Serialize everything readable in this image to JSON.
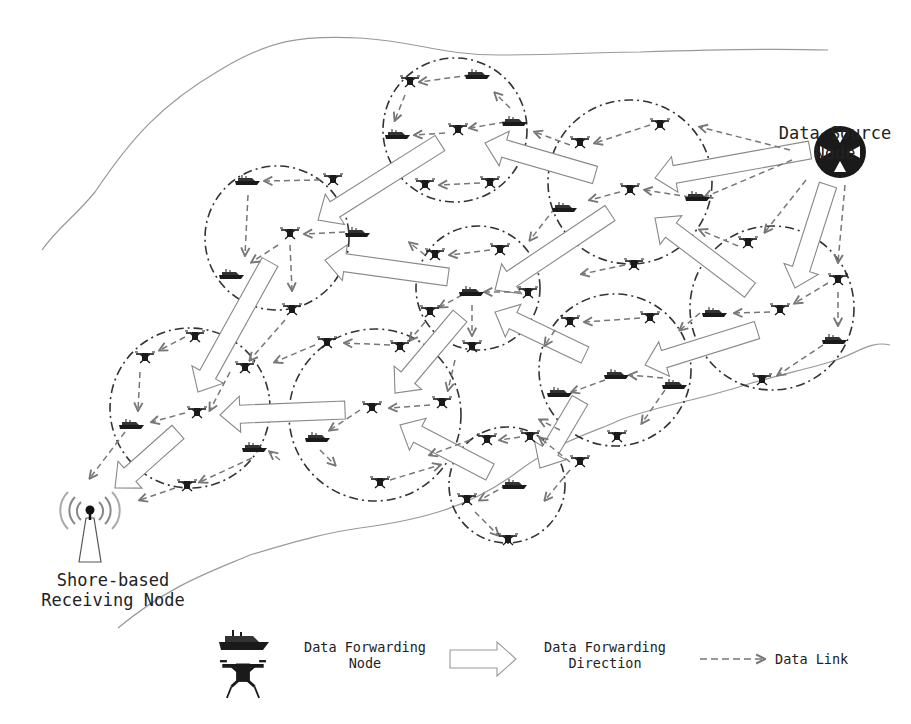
{
  "diagram": {
    "labels": {
      "source_line1": "Data Source",
      "source_line2": "Node",
      "shore_line1": "Shore-based",
      "shore_line2": "Receiving Node"
    },
    "legend": {
      "node_line1": "Data Forwarding",
      "node_line2": "Node",
      "direction_line1": "Data Forwarding",
      "direction_line2": "Direction",
      "link": "Data Link"
    },
    "colors": {
      "cluster_circle": "#333333",
      "data_link": "#777777",
      "forward_arrow_stroke": "#888888",
      "coastline": "#999999",
      "node_fill": "#1a1a1a",
      "text": "#222222"
    },
    "clusters": [
      {
        "cx": 455,
        "cy": 130,
        "r": 72
      },
      {
        "cx": 277,
        "cy": 238,
        "r": 72
      },
      {
        "cx": 630,
        "cy": 182,
        "r": 82
      },
      {
        "cx": 478,
        "cy": 288,
        "r": 62
      },
      {
        "cx": 772,
        "cy": 308,
        "r": 82
      },
      {
        "cx": 190,
        "cy": 408,
        "r": 80
      },
      {
        "cx": 375,
        "cy": 415,
        "r": 86
      },
      {
        "cx": 615,
        "cy": 370,
        "r": 76
      },
      {
        "cx": 507,
        "cy": 485,
        "r": 58
      }
    ],
    "nodes": [
      {
        "type": "drone",
        "x": 410,
        "y": 82
      },
      {
        "type": "boat",
        "x": 478,
        "y": 75
      },
      {
        "type": "boat",
        "x": 398,
        "y": 135
      },
      {
        "type": "drone",
        "x": 458,
        "y": 130
      },
      {
        "type": "boat",
        "x": 515,
        "y": 122
      },
      {
        "type": "drone",
        "x": 425,
        "y": 185
      },
      {
        "type": "drone",
        "x": 490,
        "y": 183
      },
      {
        "type": "boat",
        "x": 248,
        "y": 181
      },
      {
        "type": "drone",
        "x": 333,
        "y": 180
      },
      {
        "type": "drone",
        "x": 290,
        "y": 234
      },
      {
        "type": "boat",
        "x": 358,
        "y": 233
      },
      {
        "type": "boat",
        "x": 232,
        "y": 275
      },
      {
        "type": "drone",
        "x": 292,
        "y": 310
      },
      {
        "type": "drone",
        "x": 660,
        "y": 125
      },
      {
        "type": "drone",
        "x": 580,
        "y": 143
      },
      {
        "type": "drone",
        "x": 630,
        "y": 190
      },
      {
        "type": "boat",
        "x": 698,
        "y": 197
      },
      {
        "type": "boat",
        "x": 565,
        "y": 208
      },
      {
        "type": "drone",
        "x": 435,
        "y": 255
      },
      {
        "type": "drone",
        "x": 500,
        "y": 250
      },
      {
        "type": "boat",
        "x": 472,
        "y": 292
      },
      {
        "type": "drone",
        "x": 528,
        "y": 293
      },
      {
        "type": "drone",
        "x": 430,
        "y": 312
      },
      {
        "type": "drone",
        "x": 472,
        "y": 347
      },
      {
        "type": "drone",
        "x": 748,
        "y": 243
      },
      {
        "type": "drone",
        "x": 838,
        "y": 280
      },
      {
        "type": "drone",
        "x": 780,
        "y": 310
      },
      {
        "type": "boat",
        "x": 715,
        "y": 313
      },
      {
        "type": "boat",
        "x": 835,
        "y": 340
      },
      {
        "type": "drone",
        "x": 762,
        "y": 380
      },
      {
        "type": "drone",
        "x": 634,
        "y": 265
      },
      {
        "type": "drone",
        "x": 570,
        "y": 322
      },
      {
        "type": "drone",
        "x": 650,
        "y": 318
      },
      {
        "type": "boat",
        "x": 617,
        "y": 375
      },
      {
        "type": "boat",
        "x": 675,
        "y": 385
      },
      {
        "type": "boat",
        "x": 560,
        "y": 393
      },
      {
        "type": "drone",
        "x": 617,
        "y": 437
      },
      {
        "type": "drone",
        "x": 145,
        "y": 358
      },
      {
        "type": "drone",
        "x": 195,
        "y": 337
      },
      {
        "type": "drone",
        "x": 245,
        "y": 368
      },
      {
        "type": "drone",
        "x": 197,
        "y": 413
      },
      {
        "type": "boat",
        "x": 132,
        "y": 425
      },
      {
        "type": "boat",
        "x": 255,
        "y": 448
      },
      {
        "type": "drone",
        "x": 187,
        "y": 486
      },
      {
        "type": "drone",
        "x": 327,
        "y": 343
      },
      {
        "type": "drone",
        "x": 400,
        "y": 347
      },
      {
        "type": "drone",
        "x": 372,
        "y": 408
      },
      {
        "type": "drone",
        "x": 442,
        "y": 403
      },
      {
        "type": "boat",
        "x": 318,
        "y": 438
      },
      {
        "type": "drone",
        "x": 380,
        "y": 483
      },
      {
        "type": "drone",
        "x": 487,
        "y": 440
      },
      {
        "type": "drone",
        "x": 530,
        "y": 437
      },
      {
        "type": "drone",
        "x": 580,
        "y": 462
      },
      {
        "type": "boat",
        "x": 515,
        "y": 485
      },
      {
        "type": "drone",
        "x": 467,
        "y": 500
      },
      {
        "type": "drone",
        "x": 508,
        "y": 540
      }
    ],
    "links": [
      [
        470,
        75,
        420,
        82
      ],
      [
        510,
        108,
        495,
        93
      ],
      [
        405,
        95,
        395,
        120
      ],
      [
        505,
        122,
        470,
        128
      ],
      [
        445,
        133,
        415,
        135
      ],
      [
        480,
        183,
        440,
        185
      ],
      [
        320,
        180,
        265,
        181
      ],
      [
        345,
        232,
        305,
        234
      ],
      [
        248,
        195,
        245,
        255
      ],
      [
        278,
        245,
        252,
        262
      ],
      [
        290,
        245,
        292,
        290
      ],
      [
        650,
        125,
        595,
        143
      ],
      [
        570,
        145,
        535,
        132
      ],
      [
        690,
        197,
        645,
        190
      ],
      [
        620,
        192,
        590,
        200
      ],
      [
        790,
        150,
        700,
        127
      ],
      [
        792,
        160,
        705,
        197
      ],
      [
        425,
        255,
        410,
        243
      ],
      [
        490,
        250,
        450,
        255
      ],
      [
        520,
        292,
        485,
        292
      ],
      [
        462,
        295,
        440,
        307
      ],
      [
        472,
        305,
        472,
        335
      ],
      [
        555,
        208,
        530,
        240
      ],
      [
        806,
        180,
        765,
        232
      ],
      [
        845,
        185,
        838,
        262
      ],
      [
        828,
        283,
        795,
        303
      ],
      [
        770,
        312,
        735,
        313
      ],
      [
        838,
        292,
        838,
        325
      ],
      [
        823,
        345,
        778,
        375
      ],
      [
        738,
        246,
        700,
        230
      ],
      [
        625,
        265,
        582,
        274
      ],
      [
        640,
        318,
        585,
        322
      ],
      [
        663,
        378,
        630,
        375
      ],
      [
        605,
        380,
        572,
        392
      ],
      [
        665,
        390,
        642,
        423
      ],
      [
        700,
        313,
        680,
        330
      ],
      [
        555,
        330,
        545,
        345
      ],
      [
        185,
        337,
        160,
        350
      ],
      [
        140,
        372,
        138,
        410
      ],
      [
        230,
        372,
        210,
        410
      ],
      [
        185,
        413,
        152,
        422
      ],
      [
        252,
        458,
        200,
        482
      ],
      [
        175,
        488,
        140,
        500
      ],
      [
        125,
        432,
        90,
        478
      ],
      [
        280,
        460,
        270,
        452
      ],
      [
        285,
        320,
        250,
        360
      ],
      [
        390,
        345,
        345,
        343
      ],
      [
        315,
        345,
        275,
        362
      ],
      [
        430,
        405,
        390,
        408
      ],
      [
        360,
        410,
        330,
        430
      ],
      [
        320,
        450,
        335,
        465
      ],
      [
        390,
        480,
        440,
        465
      ],
      [
        425,
        322,
        410,
        340
      ],
      [
        455,
        360,
        448,
        390
      ],
      [
        520,
        437,
        500,
        440
      ],
      [
        570,
        462,
        540,
        438
      ],
      [
        470,
        440,
        430,
        455
      ],
      [
        507,
        485,
        480,
        500
      ],
      [
        570,
        470,
        545,
        500
      ],
      [
        475,
        512,
        498,
        535
      ],
      [
        560,
        430,
        540,
        420
      ]
    ],
    "forward_arrows": [
      {
        "x1": 810,
        "y1": 150,
        "x2": 655,
        "y2": 178,
        "w": 18
      },
      {
        "x1": 595,
        "y1": 175,
        "x2": 485,
        "y2": 143,
        "w": 18
      },
      {
        "x1": 440,
        "y1": 143,
        "x2": 318,
        "y2": 220,
        "w": 18
      },
      {
        "x1": 610,
        "y1": 213,
        "x2": 495,
        "y2": 290,
        "w": 18
      },
      {
        "x1": 448,
        "y1": 277,
        "x2": 325,
        "y2": 260,
        "w": 18
      },
      {
        "x1": 828,
        "y1": 185,
        "x2": 795,
        "y2": 288,
        "w": 18
      },
      {
        "x1": 750,
        "y1": 290,
        "x2": 655,
        "y2": 218,
        "w": 18
      },
      {
        "x1": 757,
        "y1": 330,
        "x2": 645,
        "y2": 365,
        "w": 18
      },
      {
        "x1": 585,
        "y1": 355,
        "x2": 495,
        "y2": 312,
        "w": 18
      },
      {
        "x1": 460,
        "y1": 316,
        "x2": 395,
        "y2": 393,
        "w": 18
      },
      {
        "x1": 270,
        "y1": 262,
        "x2": 198,
        "y2": 392,
        "w": 18
      },
      {
        "x1": 345,
        "y1": 410,
        "x2": 220,
        "y2": 415,
        "w": 18
      },
      {
        "x1": 178,
        "y1": 432,
        "x2": 115,
        "y2": 488,
        "w": 18
      },
      {
        "x1": 490,
        "y1": 472,
        "x2": 400,
        "y2": 425,
        "w": 18
      },
      {
        "x1": 580,
        "y1": 400,
        "x2": 540,
        "y2": 468,
        "w": 18
      }
    ]
  }
}
